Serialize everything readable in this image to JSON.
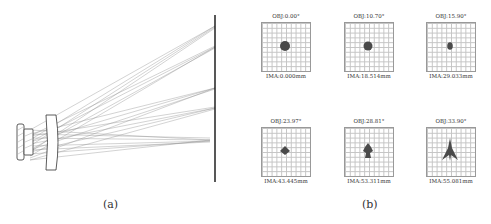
{
  "figure": {
    "panel_a": {
      "caption": "(a)",
      "description": "Lens layout with ray fans converging on image plane"
    },
    "panel_b": {
      "caption": "(b)",
      "spots": [
        {
          "obj": "OBJ:0.00°",
          "ima": "IMA:0.000mm",
          "shape": "disc-large"
        },
        {
          "obj": "OBJ:10.70°",
          "ima": "IMA:18.514mm",
          "shape": "disc-medium"
        },
        {
          "obj": "OBJ:15.90°",
          "ima": "IMA:29.033mm",
          "shape": "oval-small"
        },
        {
          "obj": "OBJ:23.97°",
          "ima": "IMA:43.445mm",
          "shape": "diamond"
        },
        {
          "obj": "OBJ:28.81°",
          "ima": "IMA:53.311mm",
          "shape": "cross"
        },
        {
          "obj": "OBJ:33.90°",
          "ima": "IMA:55.081mm",
          "shape": "arrow"
        }
      ]
    },
    "colors": {
      "spot": "#4a4a4a",
      "grid": "#c4c4c4",
      "ray": "#8a8a8a",
      "lens": "#333333",
      "image_plane": "#111111"
    }
  }
}
